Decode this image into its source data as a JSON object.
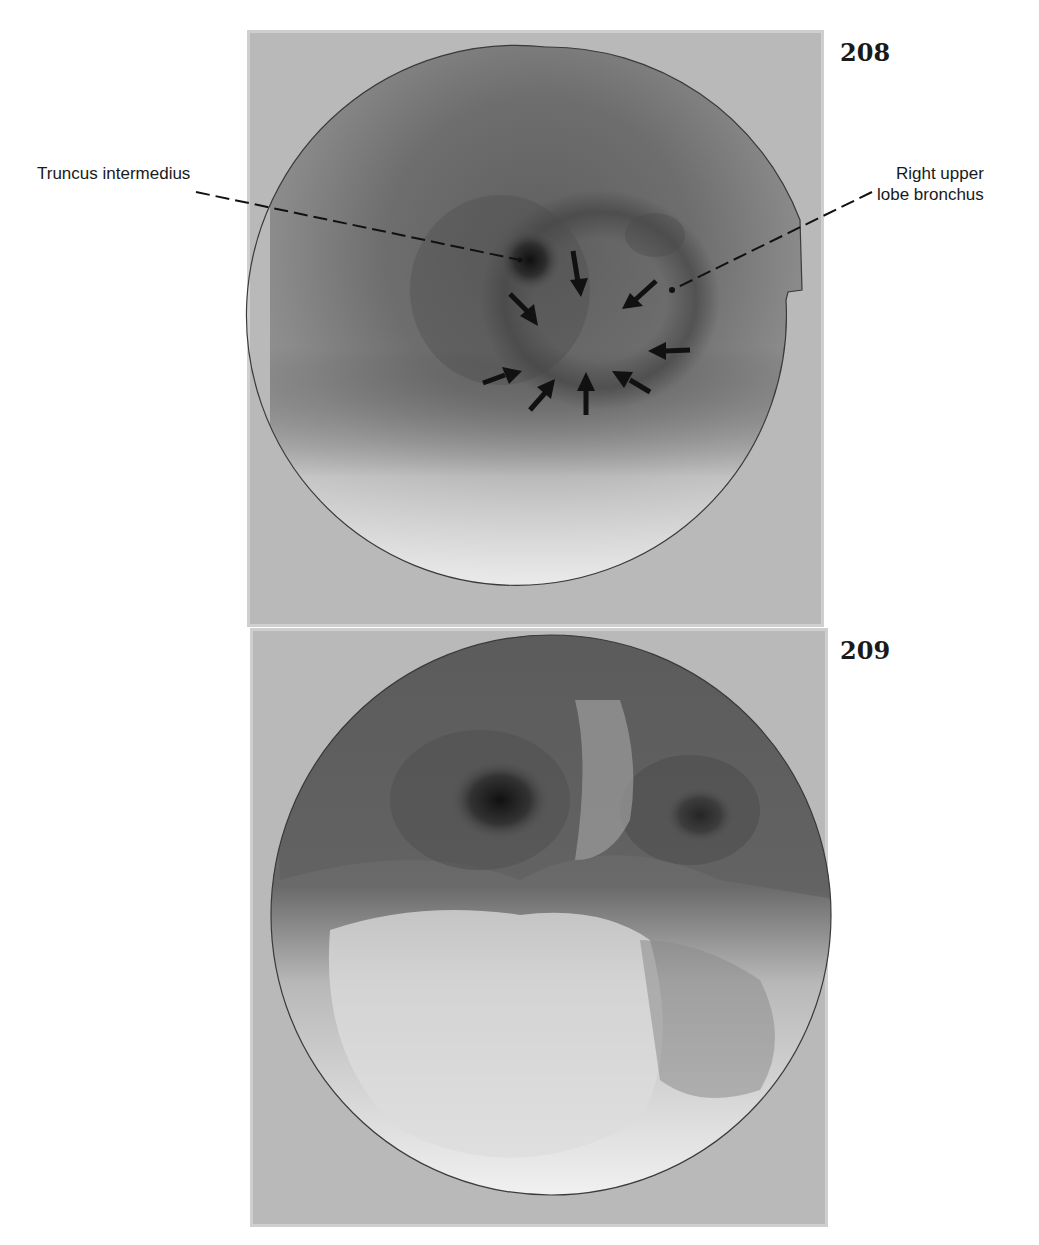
{
  "figures": [
    {
      "number": "208",
      "labels": {
        "left": "Truncus intermedius",
        "right_line1": "Right upper",
        "right_line2": "lobe bronchus"
      },
      "arrow_count": 9
    },
    {
      "number": "209"
    }
  ]
}
